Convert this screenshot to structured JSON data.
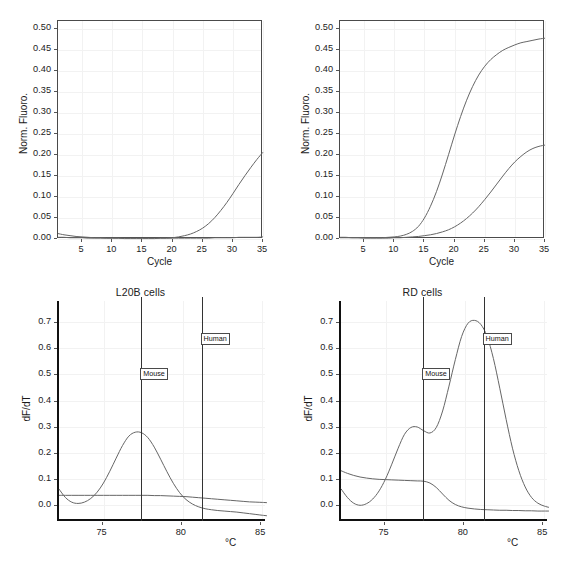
{
  "figure": {
    "panels": [
      {
        "id": "top-left",
        "title": "",
        "ylabel": "Norm. Fluoro.",
        "xlabel": "Cycle",
        "ytick_labels": [
          "0.00",
          "0.05",
          "0.10",
          "0.15",
          "0.20",
          "0.25",
          "0.30",
          "0.35",
          "0.40",
          "0.45",
          "0.50"
        ],
        "xtick_labels": [
          "5",
          "10",
          "15",
          "20",
          "25",
          "30",
          "35"
        ]
      },
      {
        "id": "top-right",
        "title": "",
        "ylabel": "Norm. Fluoro.",
        "xlabel": "Cycle",
        "ytick_labels": [
          "0.00",
          "0.05",
          "0.10",
          "0.15",
          "0.20",
          "0.25",
          "0.30",
          "0.35",
          "0.40",
          "0.45",
          "0.50"
        ],
        "xtick_labels": [
          "5",
          "10",
          "15",
          "20",
          "25",
          "30",
          "35"
        ]
      },
      {
        "id": "bottom-left",
        "title": "L20B cells",
        "ylabel": "dF/dT",
        "xlabel": "°C",
        "ytick_labels": [
          "0.0",
          "0.1",
          "0.2",
          "0.3",
          "0.4",
          "0.5",
          "0.6",
          "0.7"
        ],
        "xtick_labels": [
          "75",
          "80",
          "85"
        ],
        "markers": [
          {
            "label": "Mouse",
            "temperature": 77.5
          },
          {
            "label": "Human",
            "temperature": 81.3
          }
        ]
      },
      {
        "id": "bottom-right",
        "title": "RD cells",
        "ylabel": "dF/dT",
        "xlabel": "°C",
        "ytick_labels": [
          "0.0",
          "0.1",
          "0.2",
          "0.3",
          "0.4",
          "0.5",
          "0.6",
          "0.7"
        ],
        "xtick_labels": [
          "75",
          "80",
          "85"
        ],
        "markers": [
          {
            "label": "Mouse",
            "temperature": 77.5
          },
          {
            "label": "Human",
            "temperature": 81.3
          }
        ]
      }
    ]
  },
  "chart_data": [
    {
      "type": "line",
      "panel": "top-left",
      "title": "",
      "xlabel": "Cycle",
      "ylabel": "Norm. Fluoro.",
      "xlim": [
        1,
        35
      ],
      "ylim": [
        0.0,
        0.52
      ],
      "xticks": [
        5,
        10,
        15,
        20,
        25,
        30,
        35
      ],
      "yticks": [
        0.0,
        0.05,
        0.1,
        0.15,
        0.2,
        0.25,
        0.3,
        0.35,
        0.4,
        0.45,
        0.5
      ],
      "grid": true,
      "legend": "none",
      "x": [
        1,
        2,
        3,
        4,
        5,
        6,
        7,
        8,
        9,
        10,
        11,
        12,
        13,
        14,
        15,
        16,
        17,
        18,
        19,
        20,
        21,
        22,
        23,
        24,
        25,
        26,
        27,
        28,
        29,
        30,
        31,
        32,
        33,
        34,
        35
      ],
      "series": [
        {
          "name": "amplification-late",
          "values": [
            0.013,
            0.01,
            0.008,
            0.006,
            0.005,
            0.004,
            0.003,
            0.003,
            0.002,
            0.002,
            0.002,
            0.001,
            0.001,
            0.001,
            0.001,
            0.001,
            0.001,
            0.002,
            0.002,
            0.003,
            0.005,
            0.008,
            0.012,
            0.018,
            0.026,
            0.037,
            0.051,
            0.068,
            0.087,
            0.108,
            0.13,
            0.151,
            0.171,
            0.19,
            0.207
          ]
        },
        {
          "name": "flat-baseline",
          "values": [
            0.004,
            0.004,
            0.003,
            0.003,
            0.003,
            0.002,
            0.002,
            0.002,
            0.002,
            0.002,
            0.002,
            0.002,
            0.002,
            0.002,
            0.002,
            0.002,
            0.002,
            0.002,
            0.002,
            0.002,
            0.002,
            0.002,
            0.002,
            0.002,
            0.002,
            0.002,
            0.003,
            0.003,
            0.003,
            0.003,
            0.004,
            0.004,
            0.004,
            0.004,
            0.005
          ]
        }
      ]
    },
    {
      "type": "line",
      "panel": "top-right",
      "title": "",
      "xlabel": "Cycle",
      "ylabel": "Norm. Fluoro.",
      "xlim": [
        1,
        35
      ],
      "ylim": [
        0.0,
        0.52
      ],
      "xticks": [
        5,
        10,
        15,
        20,
        25,
        30,
        35
      ],
      "yticks": [
        0.0,
        0.05,
        0.1,
        0.15,
        0.2,
        0.25,
        0.3,
        0.35,
        0.4,
        0.45,
        0.5
      ],
      "grid": true,
      "legend": "none",
      "x": [
        1,
        2,
        3,
        4,
        5,
        6,
        7,
        8,
        9,
        10,
        11,
        12,
        13,
        14,
        15,
        16,
        17,
        18,
        19,
        20,
        21,
        22,
        23,
        24,
        25,
        26,
        27,
        28,
        29,
        30,
        31,
        32,
        33,
        34,
        35
      ],
      "series": [
        {
          "name": "amplification-early",
          "values": [
            0.004,
            0.004,
            0.003,
            0.003,
            0.003,
            0.003,
            0.003,
            0.003,
            0.004,
            0.005,
            0.007,
            0.011,
            0.018,
            0.03,
            0.05,
            0.078,
            0.113,
            0.155,
            0.201,
            0.248,
            0.292,
            0.331,
            0.364,
            0.391,
            0.412,
            0.428,
            0.44,
            0.45,
            0.457,
            0.463,
            0.468,
            0.471,
            0.474,
            0.477,
            0.479
          ]
        },
        {
          "name": "amplification-late",
          "values": [
            0.003,
            0.003,
            0.003,
            0.003,
            0.002,
            0.002,
            0.002,
            0.002,
            0.002,
            0.003,
            0.003,
            0.004,
            0.005,
            0.006,
            0.008,
            0.01,
            0.013,
            0.017,
            0.022,
            0.029,
            0.038,
            0.049,
            0.062,
            0.077,
            0.094,
            0.112,
            0.131,
            0.15,
            0.168,
            0.184,
            0.197,
            0.208,
            0.216,
            0.221,
            0.224
          ]
        }
      ]
    },
    {
      "type": "line",
      "panel": "bottom-left",
      "title": "L20B cells",
      "xlabel": "°C",
      "ylabel": "dF/dT",
      "xlim": [
        72.2,
        85.3
      ],
      "ylim": [
        -0.06,
        0.78
      ],
      "xticks": [
        75,
        80,
        85
      ],
      "yticks": [
        0.0,
        0.1,
        0.2,
        0.3,
        0.4,
        0.5,
        0.6,
        0.7
      ],
      "grid": true,
      "legend": "none",
      "annotations": [
        {
          "label": "Mouse",
          "x": 77.5
        },
        {
          "label": "Human",
          "x": 81.3
        }
      ],
      "x": [
        72.2,
        72.6,
        73.0,
        73.4,
        73.8,
        74.2,
        74.6,
        75.0,
        75.4,
        75.8,
        76.2,
        76.6,
        77.0,
        77.4,
        77.8,
        78.2,
        78.6,
        79.0,
        79.4,
        79.8,
        80.2,
        80.6,
        81.0,
        81.4,
        81.8,
        82.2,
        82.6,
        83.0,
        83.4,
        83.8,
        84.2,
        84.6,
        85.0,
        85.3
      ],
      "series": [
        {
          "name": "mouse-melt-peak",
          "values": [
            0.062,
            0.03,
            0.012,
            0.007,
            0.012,
            0.026,
            0.05,
            0.085,
            0.13,
            0.18,
            0.228,
            0.264,
            0.279,
            0.277,
            0.258,
            0.222,
            0.176,
            0.128,
            0.084,
            0.048,
            0.022,
            0.005,
            -0.006,
            -0.013,
            -0.017,
            -0.02,
            -0.022,
            -0.024,
            -0.026,
            -0.029,
            -0.032,
            -0.035,
            -0.038,
            -0.04
          ]
        },
        {
          "name": "flat-trace",
          "values": [
            0.038,
            0.038,
            0.038,
            0.038,
            0.038,
            0.038,
            0.038,
            0.038,
            0.038,
            0.038,
            0.038,
            0.038,
            0.038,
            0.038,
            0.038,
            0.037,
            0.037,
            0.036,
            0.035,
            0.034,
            0.033,
            0.031,
            0.029,
            0.027,
            0.025,
            0.023,
            0.021,
            0.019,
            0.017,
            0.015,
            0.013,
            0.012,
            0.011,
            0.01
          ]
        }
      ]
    },
    {
      "type": "line",
      "panel": "bottom-right",
      "title": "RD cells",
      "xlabel": "°C",
      "ylabel": "dF/dT",
      "xlim": [
        72.2,
        85.3
      ],
      "ylim": [
        -0.06,
        0.78
      ],
      "xticks": [
        75,
        80,
        85
      ],
      "yticks": [
        0.0,
        0.1,
        0.2,
        0.3,
        0.4,
        0.5,
        0.6,
        0.7
      ],
      "grid": true,
      "legend": "none",
      "annotations": [
        {
          "label": "Mouse",
          "x": 77.5
        },
        {
          "label": "Human",
          "x": 81.3
        }
      ],
      "x": [
        72.2,
        72.6,
        73.0,
        73.4,
        73.8,
        74.2,
        74.6,
        75.0,
        75.4,
        75.8,
        76.2,
        76.6,
        77.0,
        77.4,
        77.8,
        78.2,
        78.6,
        79.0,
        79.4,
        79.8,
        80.2,
        80.6,
        81.0,
        81.4,
        81.8,
        82.2,
        82.6,
        83.0,
        83.4,
        83.8,
        84.2,
        84.6,
        85.0,
        85.3
      ],
      "series": [
        {
          "name": "human-melt-peak",
          "values": [
            0.063,
            0.03,
            0.008,
            0.0,
            0.006,
            0.024,
            0.055,
            0.1,
            0.157,
            0.218,
            0.271,
            0.297,
            0.299,
            0.285,
            0.276,
            0.297,
            0.36,
            0.455,
            0.556,
            0.645,
            0.695,
            0.706,
            0.691,
            0.645,
            0.56,
            0.447,
            0.328,
            0.218,
            0.132,
            0.07,
            0.03,
            0.008,
            -0.003,
            -0.008
          ]
        },
        {
          "name": "mouse-flat-trace",
          "values": [
            0.132,
            0.122,
            0.114,
            0.108,
            0.104,
            0.101,
            0.099,
            0.098,
            0.097,
            0.096,
            0.095,
            0.094,
            0.093,
            0.092,
            0.085,
            0.068,
            0.043,
            0.019,
            0.003,
            -0.006,
            -0.011,
            -0.014,
            -0.016,
            -0.017,
            -0.018,
            -0.019,
            -0.019,
            -0.02,
            -0.02,
            -0.021,
            -0.021,
            -0.022,
            -0.022,
            -0.022
          ]
        }
      ]
    }
  ]
}
